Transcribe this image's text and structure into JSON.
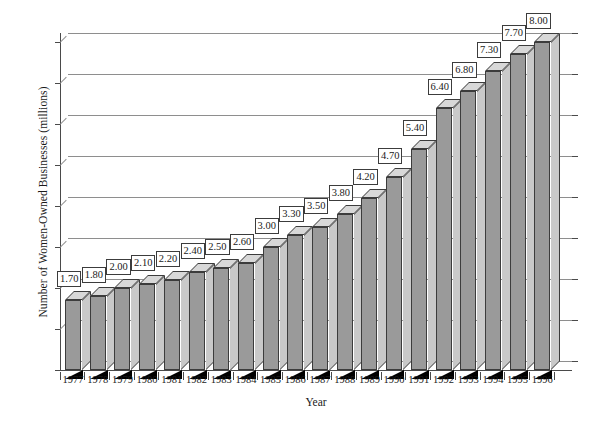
{
  "chart_data": {
    "type": "bar",
    "title": "",
    "xlabel": "Year",
    "ylabel": "Number of Women-Owned Businesses (millions)",
    "categories": [
      "1977",
      "1978",
      "1979",
      "1980",
      "1981",
      "1982",
      "1983",
      "1984",
      "1985",
      "1986",
      "1987",
      "1988",
      "1989",
      "1990",
      "1991",
      "1992",
      "1993",
      "1994",
      "1995",
      "1996"
    ],
    "values": [
      1.7,
      1.8,
      2.0,
      2.1,
      2.2,
      2.4,
      2.5,
      2.6,
      3.0,
      3.3,
      3.5,
      3.8,
      4.2,
      4.7,
      5.4,
      6.4,
      6.8,
      7.3,
      7.7,
      8.0
    ],
    "data_labels": [
      "1.70",
      "1.80",
      "2.00",
      "2.10",
      "2.20",
      "2.40",
      "2.50",
      "2.60",
      "3.00",
      "3.30",
      "3.50",
      "3.80",
      "4.20",
      "4.70",
      "5.40",
      "6.40",
      "6.80",
      "7.30",
      "7.70",
      "8.00"
    ],
    "ylim": [
      0,
      8.0
    ],
    "ytick_values": [
      0,
      1.0,
      2.0,
      3.0,
      4.0,
      5.0,
      6.0,
      7.0,
      8.0
    ],
    "ytick_labels": [
      "0.00",
      "1.0",
      "2.0",
      "3.0",
      "4.0",
      "5.0",
      "6.0",
      "7.0",
      "8.0"
    ],
    "grid": true,
    "legend": "none",
    "style": "3d-column",
    "colors": {
      "bar_front": "#9a9a9a",
      "bar_side": "#c9c9c9",
      "bar_top": "#d8d8d8",
      "bar_outline": "#3c3c3c",
      "shadow": "#000000",
      "gridline": "#8e8e8e",
      "axis": "#4a4a4a",
      "background": "#ffffff",
      "text": "#1a1a1a"
    }
  }
}
